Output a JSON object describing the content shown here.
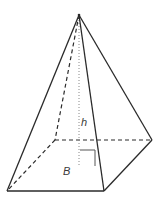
{
  "diagram": {
    "type": "square-pyramid",
    "labels": {
      "height": "h",
      "base": "B"
    },
    "colors": {
      "edge": "#2a2a2a",
      "hidden_edge": "#2a2a2a",
      "height_line": "#888888",
      "label": "#3a3a3a",
      "background": "#ffffff"
    }
  }
}
